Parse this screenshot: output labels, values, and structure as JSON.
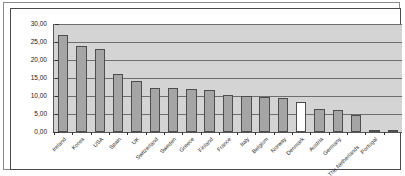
{
  "chart_data": {
    "type": "bar",
    "title": "",
    "subtitle": "",
    "xlabel": "",
    "ylabel": "",
    "ylim": [
      0,
      30
    ],
    "ytick_step": 5,
    "grid": true,
    "legend": "none",
    "decimal_separator": ",",
    "ytick_labels": [
      "30,00",
      "25,00",
      "20,00",
      "15,00",
      "10,00",
      "5,00",
      "0,00"
    ],
    "ytick_values": [
      30,
      25,
      20,
      15,
      10,
      5,
      0
    ],
    "categories": [
      "Ireland",
      "Korea",
      "USA",
      "Spain",
      "UK",
      "Switzerland",
      "Sweden",
      "Greece",
      "Finland",
      "France",
      "Italy",
      "Belgium",
      "Norway",
      "Denmark",
      "Austria",
      "Germany",
      "The Netherlands",
      "Portugal",
      ""
    ],
    "values": [
      26.9,
      24.0,
      23.0,
      16.1,
      14.3,
      12.3,
      12.1,
      12.0,
      11.8,
      10.3,
      10.0,
      9.8,
      9.5,
      8.3,
      6.3,
      6.0,
      4.7,
      0.6,
      0.5
    ],
    "highlight_index": 13,
    "highlight_category": "Austria",
    "colors": {
      "bar_fill": "#a5a5a5",
      "bar_highlight_fill": "#ffffff",
      "bar_border": "#4d4d4d",
      "plot_background": "#d4d4d4",
      "gridline": "#6e6e6e",
      "axis": "#555555",
      "text": "#1a1a1a",
      "frame_outer": "#8a8a8a",
      "frame_inner": "#4a4a4a",
      "page_background": "#ffffff"
    }
  }
}
